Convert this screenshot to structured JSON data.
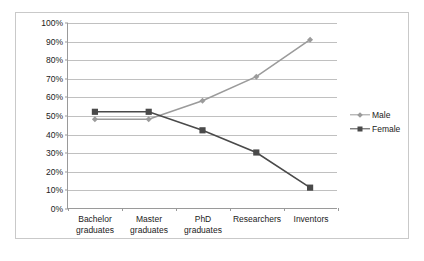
{
  "chart_data": {
    "type": "line",
    "title": "",
    "subtitle": "",
    "xlabel": "",
    "ylabel": "",
    "categories": [
      "Bachelor\ngraduates",
      "Master\ngraduates",
      "PhD\ngraduates",
      "Researchers",
      "Inventors"
    ],
    "series": [
      {
        "name": "Male",
        "values": [
          48,
          48,
          58,
          71,
          91
        ],
        "color": "#9b9b9b",
        "marker": "diamond"
      },
      {
        "name": "Female",
        "values": [
          52,
          52,
          42,
          30,
          11
        ],
        "color": "#4a4a4a",
        "marker": "square"
      }
    ],
    "ylim": [
      0,
      100
    ],
    "ytick_labels": [
      "100%",
      "90%",
      "80%",
      "70%",
      "60%",
      "50%",
      "40%",
      "30%",
      "20%",
      "10%",
      "0%"
    ],
    "ytick_values": [
      100,
      90,
      80,
      70,
      60,
      50,
      40,
      30,
      20,
      10,
      0
    ],
    "grid": true,
    "grid_axis": "y",
    "legend_position": "right",
    "legend": [
      "Male",
      "Female"
    ],
    "value_suffix": "%",
    "colors": {
      "male": "#9b9b9b",
      "female": "#4a4a4a",
      "gridline": "#c0c0c0",
      "axis": "#9a9a9a",
      "border": "#c9c9c9",
      "text": "#1b1b1b",
      "background": "#ffffff"
    }
  }
}
